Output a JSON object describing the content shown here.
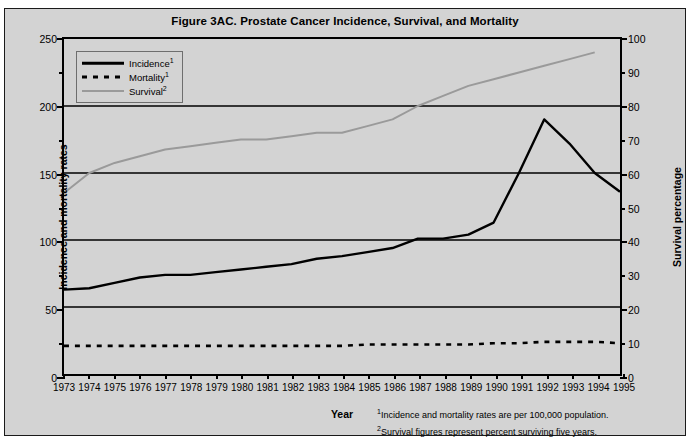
{
  "figure": {
    "title": "Figure 3AC. Prostate Cancer Incidence, Survival, and Mortality",
    "xaxis_title": "Year",
    "footnote_1": "Incidence and mortality rates are per 100,000 population.",
    "footnote_2": "Survival figures represent percent surviving five years.",
    "footnote_1_marker": "1",
    "footnote_2_marker": "2"
  },
  "legend": {
    "items": [
      {
        "label": "Incidence",
        "sup": "1",
        "style": "solid-black",
        "color": "#000000"
      },
      {
        "label": "Mortality",
        "sup": "1",
        "style": "dashed-black",
        "color": "#000000"
      },
      {
        "label": "Survival",
        "sup": "2",
        "style": "solid-gray",
        "color": "#9a9a9a"
      }
    ]
  },
  "chart_data": {
    "type": "line",
    "title": "Figure 3AC. Prostate Cancer Incidence, Survival, and Mortality",
    "xlabel": "Year",
    "ylabel": "Incidence and mortality rates",
    "y2label": "Survival percentage",
    "xlim": [
      1973,
      1995
    ],
    "ylim": [
      0,
      250
    ],
    "y2lim": [
      0,
      100
    ],
    "yticks": [
      0,
      50,
      100,
      150,
      200,
      250
    ],
    "yticks_minor": [
      25,
      75,
      125,
      175,
      225
    ],
    "y2ticks": [
      0,
      10,
      20,
      30,
      40,
      50,
      60,
      70,
      80,
      90,
      100
    ],
    "grid": "horizontal",
    "legend_position": "top-left",
    "x": [
      1973,
      1974,
      1975,
      1976,
      1977,
      1978,
      1979,
      1980,
      1981,
      1982,
      1983,
      1984,
      1985,
      1986,
      1987,
      1988,
      1989,
      1990,
      1991,
      1992,
      1993,
      1994,
      1995
    ],
    "xticklabels": [
      "1973",
      "1974",
      "1975",
      "1976",
      "1977",
      "1978",
      "1979",
      "1980",
      "1981",
      "1982",
      "1983",
      "1984",
      "1985",
      "1986",
      "1987",
      "1988",
      "1989",
      "1990",
      "1991",
      "1992",
      "1993",
      "1994",
      "1995"
    ],
    "series": [
      {
        "name": "Incidence",
        "axis": "left",
        "units": "per 100,000 population",
        "color": "#000000",
        "style": "solid",
        "values": [
          63,
          64,
          68,
          72,
          74,
          74,
          76,
          78,
          80,
          82,
          86,
          88,
          91,
          94,
          101,
          101,
          104,
          113,
          150,
          190,
          172,
          150,
          136
        ]
      },
      {
        "name": "Mortality",
        "axis": "left",
        "units": "per 100,000 population",
        "color": "#000000",
        "style": "dashed",
        "values": [
          21,
          21,
          21,
          21,
          21,
          21,
          21,
          21,
          21,
          21,
          21,
          21,
          22,
          22,
          22,
          22,
          22,
          23,
          23,
          24,
          24,
          24,
          23
        ]
      },
      {
        "name": "Survival",
        "axis": "right",
        "units": "percent surviving five years",
        "color": "#9a9a9a",
        "style": "solid",
        "values": [
          54,
          60,
          63,
          65,
          67,
          68,
          69,
          70,
          70,
          71,
          72,
          72,
          74,
          76,
          80,
          83,
          86,
          88,
          90,
          92,
          94,
          96,
          null
        ]
      }
    ]
  },
  "axes": {
    "left": {
      "title": "Incidence and mortality rates",
      "labels": [
        "250",
        "200",
        "150",
        "100",
        "50",
        "0"
      ]
    },
    "right": {
      "title": "Survival percentage",
      "labels": [
        "100",
        "90",
        "80",
        "70",
        "60",
        "50",
        "40",
        "30",
        "20",
        "10",
        "0"
      ]
    }
  }
}
